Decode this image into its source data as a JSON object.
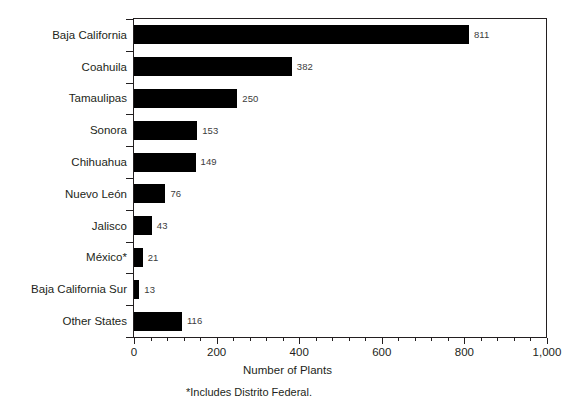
{
  "chart_data": {
    "type": "bar",
    "orientation": "horizontal",
    "title": "",
    "xlabel": "Number of Plants",
    "ylabel": "",
    "xlim": [
      0,
      1000
    ],
    "grid": false,
    "legend": null,
    "categories": [
      "Baja California",
      "Coahuila",
      "Tamaulipas",
      "Sonora",
      "Chihuahua",
      "Nuevo León",
      "Jalisco",
      "México*",
      "Baja California Sur",
      "Other States"
    ],
    "values": [
      811,
      382,
      250,
      153,
      149,
      76,
      43,
      21,
      13,
      116
    ],
    "value_labels": [
      "811",
      "382",
      "250",
      "153",
      "149",
      "76",
      "43",
      "21",
      "13",
      "116"
    ],
    "xticks": [
      0,
      200,
      400,
      600,
      800,
      1000
    ],
    "xtick_labels": [
      "0",
      "200",
      "400",
      "600",
      "800",
      "1,000"
    ],
    "minor_ticks_per_interval": 4,
    "annotations": [
      "*Includes Distrito Federal."
    ],
    "bar_color": "#000000",
    "axis_color": "#231f20",
    "value_label_color": "#3c3c3c"
  },
  "footnote": "*Includes Distrito Federal."
}
